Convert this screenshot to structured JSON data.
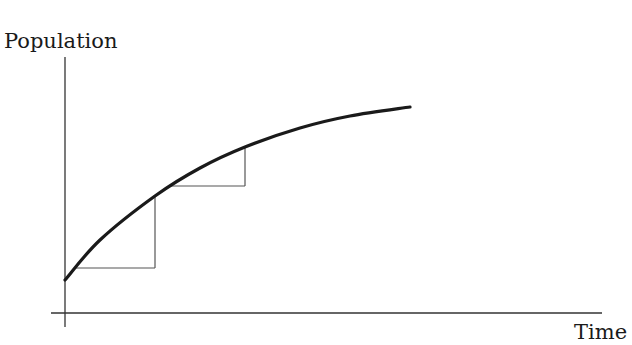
{
  "chart_data": {
    "type": "line",
    "title": "",
    "xlabel": "Time",
    "ylabel": "Population",
    "grid": false,
    "legend": null,
    "ticks": {
      "x": [],
      "y": []
    },
    "series": [
      {
        "name": "population curve",
        "style": "thick black concave increasing curve",
        "points_px": [
          [
            65,
            280
          ],
          [
            100,
            240
          ],
          [
            155,
            196
          ],
          [
            200,
            168
          ],
          [
            245,
            147
          ],
          [
            300,
            128
          ],
          [
            350,
            116
          ],
          [
            410,
            107
          ]
        ]
      },
      {
        "name": "step approximation",
        "style": "thin gray staircase",
        "steps_px": [
          {
            "horizontal": {
              "y": 268,
              "x_from": 76,
              "x_to": 155
            },
            "vertical": {
              "x": 155,
              "y_from": 268,
              "y_to": 196
            }
          },
          {
            "horizontal": {
              "y": 186,
              "x_from": 168,
              "x_to": 245
            },
            "vertical": {
              "x": 245,
              "y_from": 186,
              "y_to": 147
            }
          }
        ]
      }
    ],
    "axes_px": {
      "y_axis": {
        "x": 65,
        "y_top": 57,
        "y_bottom": 327
      },
      "x_axis": {
        "y": 313,
        "x_left": 51,
        "x_right": 602
      }
    }
  },
  "labels": {
    "y": "Population",
    "x": "Time"
  },
  "colors": {
    "curve": "#1a1a1a",
    "axes": "#333333",
    "steps": "#555555",
    "background": "#ffffff"
  }
}
